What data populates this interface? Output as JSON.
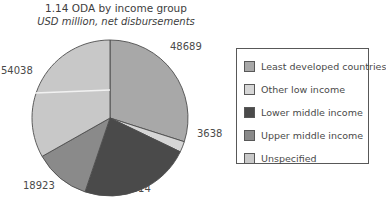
{
  "chart_data": {
    "type": "pie",
    "title": "1.14 ODA by income group",
    "subtitle": "USD million, net disbursements",
    "xlabel": "",
    "ylabel": "",
    "legend_position": "right",
    "grid": false,
    "total": 162802,
    "categories": [
      "Least developed countries",
      "Other low income",
      "Lower middle income",
      "Upper middle income",
      "Unspecified"
    ],
    "values": [
      48689,
      3638,
      37514,
      18923,
      54038
    ],
    "colors": [
      "#a8a8a8",
      "#d6d6d6",
      "#4a4a4a",
      "#8a8a8a",
      "#c8c8c8"
    ],
    "slices": [
      {
        "label": "Least developed countries",
        "value": 48689,
        "display": "48689",
        "color": "#a8a8a8",
        "start_angle": 0.0,
        "end_angle": 107.7
      },
      {
        "label": "Other low income",
        "value": 3638,
        "display": "3638",
        "color": "#d6d6d6",
        "start_angle": 107.7,
        "end_angle": 115.7
      },
      {
        "label": "Lower middle income",
        "value": 37514,
        "display": "37514",
        "color": "#4a4a4a",
        "start_angle": 115.7,
        "end_angle": 198.7
      },
      {
        "label": "Upper middle income",
        "value": 18923,
        "display": "18923",
        "color": "#8a8a8a",
        "start_angle": 198.7,
        "end_angle": 240.5
      },
      {
        "label": "Unspecified",
        "value": 54038,
        "display": "54038",
        "color": "#c8c8c8",
        "start_angle": 240.5,
        "end_angle": 360.0
      }
    ],
    "data_labels": [
      "48689",
      "3638",
      "37514",
      "18923",
      "54038"
    ]
  },
  "legend": {
    "items": [
      {
        "label": "Least developed countries",
        "color": "#a8a8a8"
      },
      {
        "label": "Other low income",
        "color": "#d6d6d6"
      },
      {
        "label": "Lower middle income",
        "color": "#4a4a4a"
      },
      {
        "label": "Upper middle income",
        "color": "#8a8a8a"
      },
      {
        "label": "Unspecified",
        "color": "#c8c8c8"
      }
    ]
  }
}
